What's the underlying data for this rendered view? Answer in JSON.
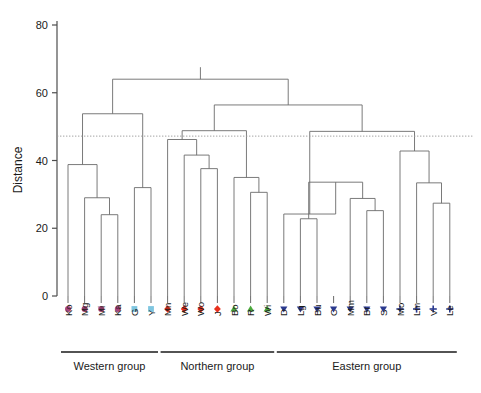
{
  "figure": {
    "type": "dendrogram",
    "background": "#ffffff",
    "width": 481,
    "height": 393
  },
  "axis": {
    "y_title": "Distance",
    "y_ticks": [
      0,
      20,
      40,
      60,
      80
    ],
    "y_min": 0,
    "y_max": 80,
    "y_tick_labels": [
      "0",
      "20",
      "40",
      "60",
      "80"
    ]
  },
  "threshold": {
    "value": 47.2,
    "style": "dotted",
    "color": "#9a9a9a"
  },
  "marker_styles": {
    "purple-circle": {
      "shape": "circle",
      "color": "#a8457c"
    },
    "lightblue-square": {
      "shape": "square",
      "color": "#7fc6e0"
    },
    "red-diamond": {
      "shape": "diamond",
      "color": "#e8301c"
    },
    "green-triangle": {
      "shape": "triangle-up",
      "color": "#4aa93c"
    },
    "navy-triangle-down": {
      "shape": "triangle-down",
      "color": "#2b3a8f"
    },
    "navy-plus": {
      "shape": "plus",
      "color": "#2b3a8f"
    }
  },
  "chart_data": {
    "type": "dendrogram",
    "title": "",
    "xlabel": "",
    "ylabel": "Distance",
    "ylim": [
      0,
      80
    ],
    "grid": false,
    "legend": "none",
    "threshold_line": 47.2,
    "leaves": [
      {
        "label": "Ko",
        "marker": "purple-circle",
        "group": "Western group"
      },
      {
        "label": "Mg",
        "marker": "purple-circle",
        "group": "Western group"
      },
      {
        "label": "Mi",
        "marker": "purple-circle",
        "group": "Western group"
      },
      {
        "label": "Ka",
        "marker": "purple-circle",
        "group": "Western group"
      },
      {
        "label": "G",
        "marker": "lightblue-square",
        "group": "Western group"
      },
      {
        "label": "Y",
        "marker": "lightblue-square",
        "group": "Western group"
      },
      {
        "label": "Mn",
        "marker": "red-diamond",
        "group": "Northern group"
      },
      {
        "label": "We",
        "marker": "red-diamond",
        "group": "Northern group"
      },
      {
        "label": "Wo",
        "marker": "red-diamond",
        "group": "Northern group"
      },
      {
        "label": "J",
        "marker": "red-diamond",
        "group": "Northern group"
      },
      {
        "label": "Bo",
        "marker": "green-triangle",
        "group": "Northern group"
      },
      {
        "label": "R",
        "marker": "green-triangle",
        "group": "Northern group"
      },
      {
        "label": "Wi",
        "marker": "green-triangle",
        "group": "Northern group"
      },
      {
        "label": "D",
        "marker": "navy-triangle-down",
        "group": "Eastern group"
      },
      {
        "label": "Lg",
        "marker": "navy-triangle-down",
        "group": "Eastern group"
      },
      {
        "label": "Bu",
        "marker": "navy-triangle-down",
        "group": "Eastern group"
      },
      {
        "label": "C",
        "marker": "navy-triangle-down",
        "group": "Eastern group"
      },
      {
        "label": "Mm",
        "marker": "navy-triangle-down",
        "group": "Eastern group"
      },
      {
        "label": "Br",
        "marker": "navy-triangle-down",
        "group": "Eastern group"
      },
      {
        "label": "S",
        "marker": "navy-triangle-down",
        "group": "Eastern group"
      },
      {
        "label": "Mo",
        "marker": "navy-plus",
        "group": "Eastern group"
      },
      {
        "label": "Lm",
        "marker": "navy-plus",
        "group": "Eastern group"
      },
      {
        "label": "V",
        "marker": "navy-plus",
        "group": "Eastern group"
      },
      {
        "label": "Le",
        "marker": "navy-plus",
        "group": "Eastern group"
      }
    ],
    "merges": [
      {
        "id": "n1",
        "left": "Mi",
        "right": "Ka",
        "height": 24.0
      },
      {
        "id": "n2",
        "left": "Mg",
        "right": "n1",
        "height": 29.0
      },
      {
        "id": "n3",
        "left": "Ko",
        "right": "n2",
        "height": 38.8
      },
      {
        "id": "n4",
        "left": "G",
        "right": "Y",
        "height": 32.0
      },
      {
        "id": "n5",
        "left": "n3",
        "right": "n4",
        "height": 53.8
      },
      {
        "id": "n6",
        "left": "Wo",
        "right": "J",
        "height": 37.6
      },
      {
        "id": "n7",
        "left": "We",
        "right": "n6",
        "height": 41.6
      },
      {
        "id": "n8",
        "left": "Mn",
        "right": "n7",
        "height": 46.2
      },
      {
        "id": "n9",
        "left": "R",
        "right": "Wi",
        "height": 30.6
      },
      {
        "id": "n10",
        "left": "Bo",
        "right": "n9",
        "height": 35.0
      },
      {
        "id": "n11",
        "left": "n8",
        "right": "n10",
        "height": 48.8
      },
      {
        "id": "n12",
        "left": "Lg",
        "right": "Bu",
        "height": 22.8
      },
      {
        "id": "n13",
        "left": "Br",
        "right": "S",
        "height": 25.2
      },
      {
        "id": "n14",
        "left": "Mm",
        "right": "n13",
        "height": 28.8
      },
      {
        "id": "n15",
        "left": "n12",
        "right": "n14",
        "height": 33.6
      },
      {
        "id": "n16",
        "left": "D",
        "right": "n15",
        "height": 24.2
      },
      {
        "id": "n17",
        "left": "V",
        "right": "Le",
        "height": 27.4
      },
      {
        "id": "n18",
        "left": "Lm",
        "right": "n17",
        "height": 33.4
      },
      {
        "id": "n19",
        "left": "Mo",
        "right": "n18",
        "height": 42.8
      },
      {
        "id": "n20",
        "left": "n16",
        "right": "n19",
        "height": 48.6
      },
      {
        "id": "n21",
        "left": "n11",
        "right": "n20",
        "height": 56.4
      },
      {
        "id": "n22",
        "left": "n5",
        "right": "n21",
        "height": 64.0
      }
    ]
  },
  "groups": [
    {
      "label": "Western group",
      "first_leaf": "Ko",
      "last_leaf": "Y"
    },
    {
      "label": "Northern group",
      "first_leaf": "Mn",
      "last_leaf": "Wi"
    },
    {
      "label": "Eastern group",
      "first_leaf": "D",
      "last_leaf": "Le"
    }
  ]
}
